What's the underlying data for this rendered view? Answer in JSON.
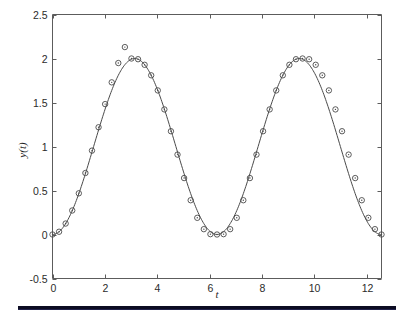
{
  "figure": {
    "background_color": "#ffffff",
    "axis_color": "#5c5c5c",
    "line_color": "#4a4a4a",
    "marker_color": "#4a4a4a",
    "rule_color": "#0c0c22"
  },
  "axes": {
    "x_title": "t",
    "y_title": "y(t)",
    "x_tick_labels": [
      "0",
      "2",
      "4",
      "6",
      "8",
      "10",
      "12"
    ],
    "y_tick_labels": [
      "-0.5",
      "0",
      "0.5",
      "1",
      "1.5",
      "2",
      "2.5"
    ]
  },
  "chart_data": {
    "type": "line",
    "title": "",
    "xlabel": "t",
    "ylabel": "y(t)",
    "xlim": [
      0,
      12.566
    ],
    "ylim": [
      -0.5,
      2.5
    ],
    "xticks": [
      0,
      2,
      4,
      6,
      8,
      10,
      12
    ],
    "yticks": [
      -0.5,
      0,
      0.5,
      1,
      1.5,
      2,
      2.5
    ],
    "grid": false,
    "legend": null,
    "marker": "circle",
    "series": [
      {
        "name": "y(t)",
        "expression": "1 - cos(t)",
        "x": [
          0,
          0.2513,
          0.5027,
          0.754,
          1.0053,
          1.2566,
          1.508,
          1.7593,
          2.0106,
          2.2619,
          2.5133,
          2.7646,
          3.0159,
          3.2673,
          3.5186,
          3.7699,
          4.0212,
          4.2726,
          4.5239,
          4.7752,
          5.0265,
          5.2779,
          5.5292,
          5.7805,
          6.0319,
          6.2832,
          6.5345,
          6.7858,
          7.0372,
          7.2885,
          7.5398,
          7.7911,
          8.0425,
          8.2938,
          8.5451,
          8.7965,
          9.0478,
          9.2991,
          9.5504,
          9.8018,
          10.0531,
          10.3044,
          10.5558,
          10.8071,
          11.0584,
          11.3097,
          11.5611,
          11.8124,
          12.0637,
          12.315,
          12.5664
        ],
        "y": [
          0.0,
          0.0314,
          0.1246,
          0.273,
          0.4679,
          0.6987,
          0.9533,
          1.2187,
          1.4818,
          1.729,
          1.9484,
          2.1298,
          2.0,
          1.9918,
          1.9284,
          1.809,
          1.6374,
          1.4215,
          1.1736,
          0.908,
          0.6412,
          0.3894,
          0.1895,
          0.0607,
          0.0039,
          0.0,
          0.0039,
          0.0607,
          0.1895,
          0.3894,
          0.6412,
          0.908,
          1.1736,
          1.4215,
          1.6374,
          1.809,
          1.9284,
          1.9918,
          2.0,
          1.9918,
          1.9284,
          1.809,
          1.6374,
          1.4215,
          1.1736,
          0.908,
          0.6412,
          0.3894,
          0.1895,
          0.0607,
          0.0
        ]
      }
    ]
  }
}
